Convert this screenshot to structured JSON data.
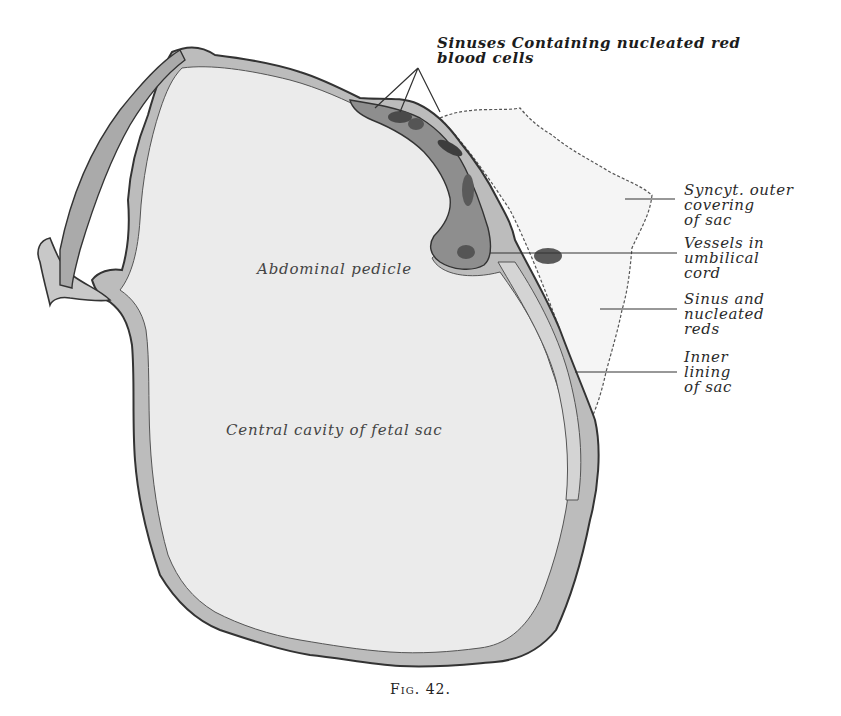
{
  "figure": {
    "caption": "Fig. 42.",
    "labels": {
      "sinuses_top": "Sinuses Containing nucleated red\nblood cells",
      "syncyt_outer": "Syncyt. outer\ncovering\nof sac",
      "vessels_cord": "Vessels in\numbilical\ncord",
      "sinus_reds": "Sinus and\nnucleated\nreds",
      "inner_lining": "Inner\nlining\nof sac",
      "abdominal_pedicle": "Abdominal pedicle",
      "central_cavity": "Central cavity of fetal sac"
    },
    "colors": {
      "background": "#ffffff",
      "cavity_fill": "#ececec",
      "wall_fill": "#b9b9b9",
      "wall_stroke": "#3a3a3a",
      "sinus_dark": "#4a4a4a",
      "outer_covering_fill": "#f4f4f4",
      "leader_line": "#333333"
    }
  }
}
